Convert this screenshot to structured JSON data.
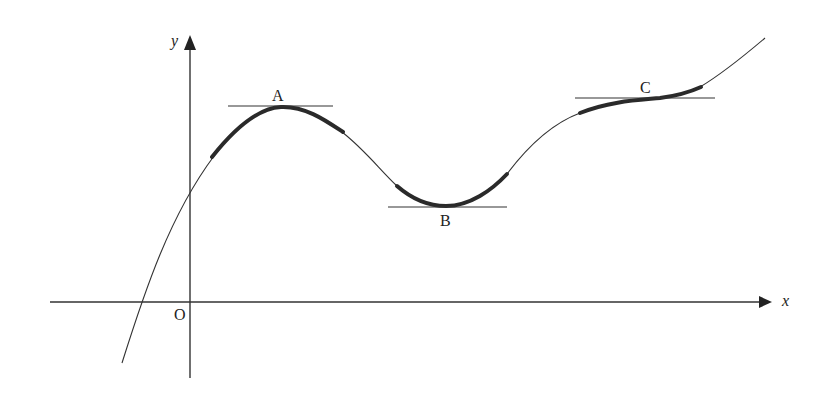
{
  "diagram": {
    "axes": {
      "x_label": "x",
      "y_label": "y",
      "origin_label": "O"
    },
    "points": [
      {
        "id": "A",
        "label": "A",
        "type": "local maximum"
      },
      {
        "id": "B",
        "label": "B",
        "type": "local minimum"
      },
      {
        "id": "C",
        "label": "C",
        "type": "stationary point of inflection"
      }
    ],
    "colors": {
      "curve": "#333333",
      "highlight": "#2a2a2a",
      "axis": "#333333",
      "tangent": "#333333",
      "background": "#ffffff"
    }
  }
}
